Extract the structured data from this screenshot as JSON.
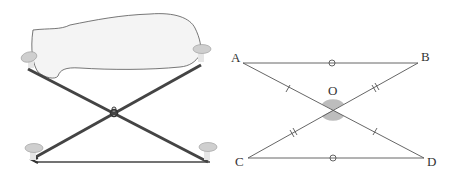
{
  "left_figure": {
    "description": "folding stool with crossed legs and cloth seat",
    "parts": [
      "seat-cloth",
      "leg-top-left",
      "leg-top-right",
      "leg-bottom-left",
      "leg-bottom-right",
      "pivot-joint",
      "bottom-bar"
    ]
  },
  "right_figure": {
    "description": "two triangles AOB-like intersecting at O with equal-length tick marks",
    "points": {
      "A": {
        "label": "A"
      },
      "B": {
        "label": "B"
      },
      "C": {
        "label": "C"
      },
      "D": {
        "label": "D"
      },
      "O": {
        "label": "O"
      }
    },
    "segments": [
      "AB",
      "CD",
      "AD",
      "BC"
    ],
    "marks": {
      "AB": "circle",
      "CD": "circle",
      "AO": "single-tick",
      "OD": "single-tick",
      "BO": "double-tick",
      "OC": "double-tick",
      "angle_O": "shaded-vertical-angles"
    },
    "colors": {
      "line": "#555555",
      "shade": "#bdbdbd"
    }
  }
}
